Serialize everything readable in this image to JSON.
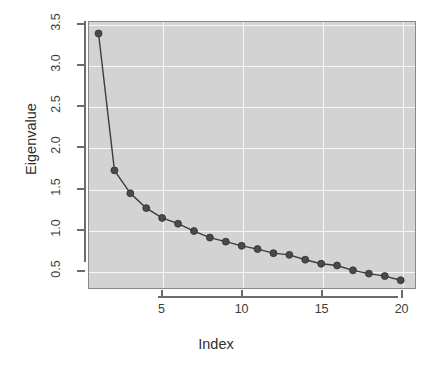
{
  "chart_data": {
    "type": "line",
    "title": "",
    "xlabel": "Index",
    "ylabel": "Eigenvalue",
    "x": [
      1,
      2,
      3,
      4,
      5,
      6,
      7,
      8,
      9,
      10,
      11,
      12,
      13,
      14,
      15,
      16,
      17,
      18,
      19,
      20
    ],
    "values": [
      3.39,
      1.72,
      1.44,
      1.26,
      1.14,
      1.07,
      0.98,
      0.9,
      0.85,
      0.8,
      0.76,
      0.71,
      0.69,
      0.63,
      0.58,
      0.56,
      0.5,
      0.46,
      0.43,
      0.38
    ],
    "series": [
      {
        "name": "Eigenvalue",
        "values": [
          3.39,
          1.72,
          1.44,
          1.26,
          1.14,
          1.07,
          0.98,
          0.9,
          0.85,
          0.8,
          0.76,
          0.71,
          0.69,
          0.63,
          0.58,
          0.56,
          0.5,
          0.46,
          0.43,
          0.38
        ]
      }
    ],
    "xlim": [
      0.4,
      20.9
    ],
    "ylim": [
      0.285,
      3.53
    ],
    "xticks": [
      5,
      10,
      15,
      20
    ],
    "xtick_labels": [
      "5",
      "10",
      "15",
      "20"
    ],
    "yticks": [
      0.5,
      1.0,
      1.5,
      2.0,
      2.5,
      3.0,
      3.5
    ],
    "ytick_labels": [
      "0.5",
      "1.0",
      "1.5",
      "2.0",
      "2.5",
      "3.0",
      "3.5"
    ],
    "grid": true,
    "grid_color": "#f7f7f7",
    "panel_background": "#d3d3d3",
    "line_color": "#3c3c3c",
    "marker": "filled-circle",
    "marker_color": "#4a4a4a",
    "legend": "none"
  },
  "axes": {
    "y_title": "Eigenvalue",
    "x_title": "Index"
  },
  "caption": {
    "sliver_text": ""
  }
}
